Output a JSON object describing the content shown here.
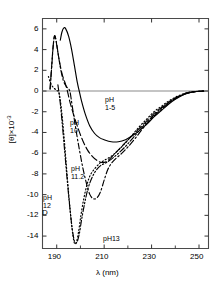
{
  "figure": {
    "panel_letter": "D",
    "background_color": "#ffffff",
    "line_color": "#000000"
  },
  "axes": {
    "x": {
      "title": "λ (nm)",
      "ticks": [
        190,
        210,
        230,
        250
      ],
      "tick_labels": [
        "190",
        "210",
        "230",
        "250"
      ],
      "range": [
        184,
        254
      ],
      "minor_ticks": [
        200,
        220,
        240
      ]
    },
    "y": {
      "title_html": "[θ]×10",
      "title_exponent": "-3",
      "title_plain": "[θ]×10⁻³",
      "ticks": [
        6,
        4,
        2,
        0,
        -2,
        -4,
        -6,
        -8,
        -10,
        -12,
        -14
      ],
      "tick_labels": [
        "6",
        "4",
        "2",
        "0",
        "-2",
        "-4",
        "-6",
        "-8",
        "-10",
        "-12",
        "-14"
      ],
      "range": [
        -15.2,
        7.0
      ]
    }
  },
  "annotations": [
    {
      "id": "ph1-5",
      "line1": "pH",
      "line2": "1-5",
      "x": 105,
      "y": 96
    },
    {
      "id": "ph10",
      "line1": "pH",
      "line2": "10",
      "x": 70,
      "y": 119
    },
    {
      "id": "ph11-2",
      "line1": "pH",
      "line2": "11.2",
      "x": 71,
      "y": 165
    },
    {
      "id": "ph12",
      "line1": "pH",
      "line2": "12",
      "x": 43,
      "y": 194
    },
    {
      "id": "ph13",
      "line1": "pH13",
      "line2": "",
      "x": 103,
      "y": 235
    }
  ],
  "chart_data": {
    "type": "line",
    "title": "",
    "xlabel": "λ (nm)",
    "ylabel": "[θ]×10⁻³",
    "xlim": [
      184,
      254
    ],
    "ylim": [
      -15.2,
      7.0
    ],
    "grid": false,
    "legend": "inline-curve-labels",
    "zero_line": true,
    "series": [
      {
        "name": "pH 1-5",
        "dash": "solid",
        "peak": {
          "x": 193,
          "y": 6.1
        },
        "zero_crossing": 199.5,
        "min": {
          "x": 216,
          "y": -4.9
        },
        "points": [
          [
            191.5,
            4.9
          ],
          [
            192.2,
            5.7
          ],
          [
            193.0,
            6.1
          ],
          [
            193.8,
            6.0
          ],
          [
            195.0,
            5.3
          ],
          [
            196.2,
            4.1
          ],
          [
            197.5,
            2.4
          ],
          [
            198.7,
            0.8
          ],
          [
            199.5,
            0.0
          ],
          [
            200.5,
            -1.0
          ],
          [
            202.0,
            -2.2
          ],
          [
            204.0,
            -3.4
          ],
          [
            206.0,
            -4.1
          ],
          [
            208.0,
            -4.5
          ],
          [
            210.0,
            -4.7
          ],
          [
            213.0,
            -4.9
          ],
          [
            216.0,
            -4.9
          ],
          [
            219.0,
            -4.7
          ],
          [
            222.0,
            -4.3
          ],
          [
            225.0,
            -3.8
          ],
          [
            228.0,
            -3.2
          ],
          [
            231.0,
            -2.5
          ],
          [
            234.0,
            -1.9
          ],
          [
            237.0,
            -1.3
          ],
          [
            240.0,
            -0.8
          ],
          [
            243.0,
            -0.4
          ],
          [
            246.0,
            -0.15
          ],
          [
            249.0,
            -0.05
          ],
          [
            252.0,
            0.0
          ]
        ]
      },
      {
        "name": "pH 10",
        "dash": "long-dash",
        "peak": {
          "x": 189,
          "y": 5.3
        },
        "zero_crossing": 194.5,
        "min": {
          "x": 209,
          "y": -6.9
        },
        "points": [
          [
            187.2,
            0.2
          ],
          [
            187.8,
            2.2
          ],
          [
            188.4,
            4.1
          ],
          [
            189.0,
            5.3
          ],
          [
            189.6,
            5.0
          ],
          [
            190.3,
            4.0
          ],
          [
            191.2,
            2.8
          ],
          [
            192.3,
            1.6
          ],
          [
            193.5,
            0.8
          ],
          [
            194.5,
            0.0
          ],
          [
            195.5,
            -1.0
          ],
          [
            197.0,
            -2.2
          ],
          [
            199.0,
            -3.6
          ],
          [
            201.0,
            -4.8
          ],
          [
            203.0,
            -5.7
          ],
          [
            205.0,
            -6.3
          ],
          [
            207.0,
            -6.7
          ],
          [
            209.0,
            -6.9
          ],
          [
            211.0,
            -6.8
          ],
          [
            213.0,
            -6.4
          ],
          [
            215.5,
            -5.8
          ],
          [
            218.0,
            -5.2
          ],
          [
            221.0,
            -4.5
          ],
          [
            224.0,
            -3.8
          ],
          [
            227.0,
            -3.1
          ],
          [
            230.0,
            -2.4
          ],
          [
            233.0,
            -1.8
          ],
          [
            236.0,
            -1.3
          ],
          [
            239.0,
            -0.8
          ],
          [
            242.0,
            -0.45
          ],
          [
            245.0,
            -0.2
          ],
          [
            248.0,
            -0.07
          ],
          [
            252.0,
            0.0
          ]
        ]
      },
      {
        "name": "pH 11.2",
        "dash": "dash-dot",
        "peak": {
          "x": 189,
          "y": 5.3
        },
        "zero_crossing": 195.5,
        "min": {
          "x": 205,
          "y": -10.4
        },
        "points": [
          [
            187.2,
            0.2
          ],
          [
            187.9,
            2.4
          ],
          [
            188.5,
            4.3
          ],
          [
            189.1,
            5.3
          ],
          [
            189.8,
            4.8
          ],
          [
            190.6,
            3.6
          ],
          [
            191.6,
            2.2
          ],
          [
            192.8,
            1.0
          ],
          [
            194.2,
            0.4
          ],
          [
            195.5,
            0.0
          ],
          [
            196.5,
            -1.4
          ],
          [
            198.0,
            -3.6
          ],
          [
            199.5,
            -5.6
          ],
          [
            201.0,
            -7.4
          ],
          [
            202.5,
            -8.9
          ],
          [
            204.0,
            -10.0
          ],
          [
            205.5,
            -10.4
          ],
          [
            207.0,
            -10.3
          ],
          [
            208.5,
            -9.7
          ],
          [
            210.0,
            -8.6
          ],
          [
            211.5,
            -7.6
          ],
          [
            213.0,
            -7.0
          ],
          [
            215.0,
            -6.5
          ],
          [
            217.5,
            -6.0
          ],
          [
            220.0,
            -5.4
          ],
          [
            223.0,
            -4.6
          ],
          [
            226.0,
            -3.7
          ],
          [
            229.0,
            -2.9
          ],
          [
            232.0,
            -2.2
          ],
          [
            235.0,
            -1.6
          ],
          [
            238.0,
            -1.05
          ],
          [
            241.0,
            -0.6
          ],
          [
            244.0,
            -0.28
          ],
          [
            247.0,
            -0.1
          ],
          [
            252.0,
            0.0
          ]
        ]
      },
      {
        "name": "pH 12",
        "dash": "dotted",
        "zero_crossing": 191.0,
        "min": {
          "x": 197,
          "y": -14.7
        },
        "points": [
          [
            186.5,
            1.4
          ],
          [
            187.2,
            0.9
          ],
          [
            188.0,
            0.5
          ],
          [
            189.0,
            0.25
          ],
          [
            190.0,
            0.05
          ],
          [
            191.0,
            -0.2
          ],
          [
            192.0,
            -1.8
          ],
          [
            193.0,
            -4.2
          ],
          [
            194.0,
            -7.0
          ],
          [
            195.0,
            -9.8
          ],
          [
            196.0,
            -12.3
          ],
          [
            196.8,
            -13.9
          ],
          [
            197.5,
            -14.7
          ],
          [
            198.3,
            -14.6
          ],
          [
            199.2,
            -13.6
          ],
          [
            200.2,
            -12.0
          ],
          [
            201.4,
            -10.4
          ],
          [
            202.8,
            -9.0
          ],
          [
            204.2,
            -8.1
          ],
          [
            206.0,
            -7.5
          ],
          [
            208.0,
            -7.0
          ],
          [
            210.0,
            -6.7
          ],
          [
            213.0,
            -6.3
          ],
          [
            216.0,
            -5.7
          ],
          [
            219.0,
            -5.0
          ],
          [
            222.0,
            -4.2
          ],
          [
            225.0,
            -3.4
          ],
          [
            228.0,
            -2.7
          ],
          [
            231.0,
            -2.0
          ],
          [
            234.0,
            -1.5
          ],
          [
            237.0,
            -1.0
          ],
          [
            240.0,
            -0.6
          ],
          [
            243.0,
            -0.3
          ],
          [
            246.0,
            -0.1
          ],
          [
            252.0,
            0.0
          ]
        ]
      },
      {
        "name": "pH 13",
        "dash": "dash-dot-dot",
        "min": {
          "x": 197.5,
          "y": -14.6
        },
        "points": [
          [
            190.5,
            0.6
          ],
          [
            191.5,
            -1.2
          ],
          [
            192.5,
            -3.6
          ],
          [
            193.5,
            -6.2
          ],
          [
            194.5,
            -8.8
          ],
          [
            195.5,
            -11.2
          ],
          [
            196.5,
            -13.2
          ],
          [
            197.5,
            -14.5
          ],
          [
            198.5,
            -14.6
          ],
          [
            199.5,
            -13.8
          ],
          [
            200.5,
            -12.4
          ],
          [
            201.8,
            -10.8
          ],
          [
            203.2,
            -9.4
          ],
          [
            204.8,
            -8.4
          ],
          [
            206.5,
            -7.7
          ],
          [
            208.5,
            -7.2
          ],
          [
            211.0,
            -6.9
          ],
          [
            214.0,
            -6.4
          ],
          [
            217.0,
            -5.8
          ],
          [
            220.0,
            -5.1
          ],
          [
            223.0,
            -4.3
          ],
          [
            226.0,
            -3.5
          ],
          [
            229.0,
            -2.8
          ],
          [
            232.0,
            -2.1
          ],
          [
            235.0,
            -1.5
          ],
          [
            238.0,
            -1.0
          ],
          [
            241.0,
            -0.6
          ],
          [
            244.0,
            -0.3
          ],
          [
            247.0,
            -0.1
          ],
          [
            252.0,
            0.0
          ]
        ]
      }
    ]
  }
}
